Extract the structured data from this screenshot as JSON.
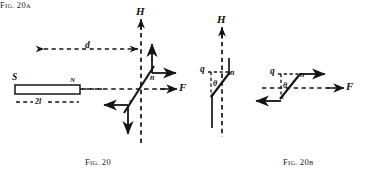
{
  "figure": {
    "background_color": "#ffffff",
    "ink_color": "#141414",
    "captions": [
      {
        "id": "fig20",
        "prefix": "F",
        "small": "IG.",
        "number": "20",
        "suffix": ""
      },
      {
        "id": "fig20a",
        "prefix": "F",
        "small": "IG.",
        "number": "20",
        "suffix": "A"
      },
      {
        "id": "fig20b",
        "prefix": "F",
        "small": "IG.",
        "number": "20",
        "suffix": "B"
      }
    ],
    "caption_text": {
      "fig20": "FIG. 20",
      "fig20a": "FIG. 20A",
      "fig20b": "FIG. 20B"
    },
    "panels": [
      {
        "id": "fig20",
        "name": "bar-magnet-and-needle",
        "labels": [
          {
            "name": "label-H",
            "text": "H",
            "size": "big"
          },
          {
            "name": "label-F",
            "text": "F",
            "size": "big"
          },
          {
            "name": "label-d",
            "text": "d",
            "size": "mid"
          },
          {
            "name": "label-S",
            "text": "S",
            "size": "mid"
          },
          {
            "name": "label-N",
            "text": "N",
            "size": "tiny"
          },
          {
            "name": "label-2l",
            "text": "2l",
            "size": "sm"
          },
          {
            "name": "label-n",
            "text": "n",
            "size": "sm"
          },
          {
            "name": "label-s",
            "text": "s",
            "size": "tiny"
          }
        ]
      },
      {
        "id": "fig20a",
        "name": "needle-deflection-diagram-a",
        "labels": [
          {
            "name": "label-H",
            "text": "H",
            "size": "big"
          },
          {
            "name": "label-q",
            "text": "q",
            "size": "mid"
          },
          {
            "name": "label-n",
            "text": "n",
            "size": "sm"
          },
          {
            "name": "label-theta",
            "text": "θ",
            "size": "sm"
          },
          {
            "name": "label-s",
            "text": "s",
            "size": "tiny"
          }
        ]
      },
      {
        "id": "fig20b",
        "name": "needle-deflection-diagram-b",
        "labels": [
          {
            "name": "label-F",
            "text": "F",
            "size": "big"
          },
          {
            "name": "label-q",
            "text": "q",
            "size": "mid"
          },
          {
            "name": "label-n",
            "text": "n",
            "size": "sm"
          },
          {
            "name": "label-theta",
            "text": "θ",
            "size": "sm"
          },
          {
            "name": "label-s",
            "text": "s",
            "size": "tiny"
          }
        ]
      }
    ]
  }
}
